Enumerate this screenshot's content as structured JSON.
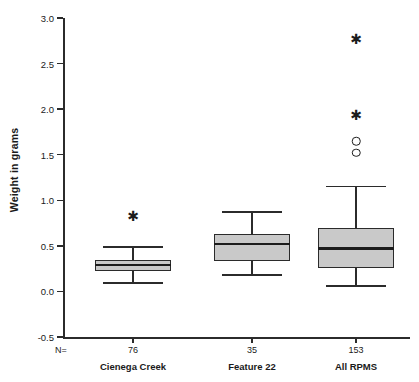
{
  "chart_data": {
    "type": "box",
    "title": "",
    "xlabel": "",
    "ylabel": "Weight in grams",
    "ylim": [
      -0.5,
      3.0
    ],
    "ytick_labels": [
      "3.0",
      "2.5",
      "2.0",
      "1.5",
      "1.0",
      "0.5",
      "0.0",
      "-0.5"
    ],
    "ytick_values": [
      3.0,
      2.5,
      2.0,
      1.5,
      1.0,
      0.5,
      0.0,
      -0.5
    ],
    "grid": false,
    "legend": "none",
    "n_prefix": "N=",
    "categories": [
      "Cienega Creek",
      "Feature 22",
      "All RPMS"
    ],
    "counts": [
      "76",
      "35",
      "153"
    ],
    "boxes": [
      {
        "category": "Cienega Creek",
        "n": 76,
        "whisker_low": 0.09,
        "q1": 0.22,
        "median": 0.29,
        "q3": 0.35,
        "whisker_high": 0.49,
        "outliers": [
          {
            "value": 0.83,
            "marker": "star"
          }
        ]
      },
      {
        "category": "Feature 22",
        "n": 35,
        "whisker_low": 0.18,
        "q1": 0.33,
        "median": 0.52,
        "q3": 0.63,
        "whisker_high": 0.87,
        "outliers": []
      },
      {
        "category": "All RPMS",
        "n": 153,
        "whisker_low": 0.06,
        "q1": 0.26,
        "median": 0.47,
        "q3": 0.7,
        "whisker_high": 1.15,
        "outliers": [
          {
            "value": 2.77,
            "marker": "star"
          },
          {
            "value": 1.94,
            "marker": "star"
          },
          {
            "value": 1.65,
            "marker": "circle"
          },
          {
            "value": 1.52,
            "marker": "circle"
          }
        ]
      }
    ],
    "colors": {
      "box_fill": "#c9c9c9",
      "box_border": "#2b2b2b",
      "median": "#1c1c1c",
      "axis": "#2b2b2b",
      "text": "#1a1a1a",
      "background": "#ffffff"
    }
  }
}
